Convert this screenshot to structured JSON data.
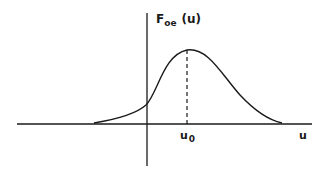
{
  "diagram": {
    "y_axis_label": {
      "main": "F",
      "subscript": "oe",
      "argument": "(u)"
    },
    "x_axis_label": "u",
    "peak_label": {
      "main": "u",
      "subscript": "0"
    },
    "curve": {
      "description": "bell-shaped distribution curve peaked at u0, shifted right of origin",
      "peak_position": "u0"
    },
    "colors": {
      "ink": "#1a1a1a",
      "background": "#ffffff"
    }
  }
}
